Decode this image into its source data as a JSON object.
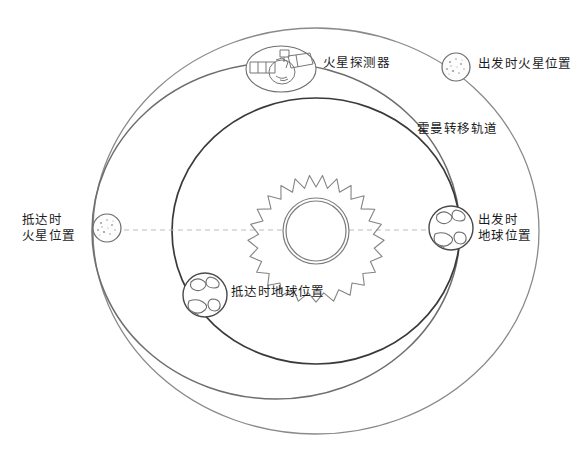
{
  "diagram": {
    "background_color": "#ffffff",
    "labels": {
      "mars_probe": "火星探测器",
      "mars_at_departure": "出发时火星位置",
      "hohmann_transfer_orbit": "霍曼转移轨道",
      "earth_at_departure": "出发时\n地球位置",
      "mars_at_arrival": "抵达时\n火星位置",
      "earth_at_arrival": "抵达时地球位置"
    },
    "colors": {
      "mars_orbit_stroke": "#8a8a8a",
      "earth_orbit_stroke": "#3a3a3a",
      "transfer_orbit_stroke": "#6e6e6e",
      "axis_dash_stroke": "#b9b9b9",
      "sun_stroke": "#7d7d7d",
      "planet_stroke": "#5a5a5a",
      "text": "#1d1d1d"
    },
    "geometry": {
      "sun_center_x": 316,
      "sun_center_y": 231,
      "sun_radius": 32,
      "mars_orbit_rx": 223,
      "mars_orbit_ry": 203,
      "earth_orbit_rx": 144,
      "earth_orbit_ry": 133,
      "transfer_orbit_rx": 184,
      "transfer_orbit_ry": 168
    },
    "bodies": [
      {
        "name": "sun",
        "x": 316,
        "y": 231,
        "r": 32
      },
      {
        "name": "mars-at-departure",
        "x": 456,
        "y": 67,
        "r": 14
      },
      {
        "name": "mars-at-arrival",
        "x": 107,
        "y": 228,
        "r": 14
      },
      {
        "name": "earth-at-departure",
        "x": 451,
        "y": 228,
        "r": 22
      },
      {
        "name": "earth-at-arrival",
        "x": 205,
        "y": 295,
        "r": 22
      },
      {
        "name": "mars-probe",
        "x": 281,
        "y": 69,
        "rx": 35,
        "ry": 23
      }
    ]
  }
}
